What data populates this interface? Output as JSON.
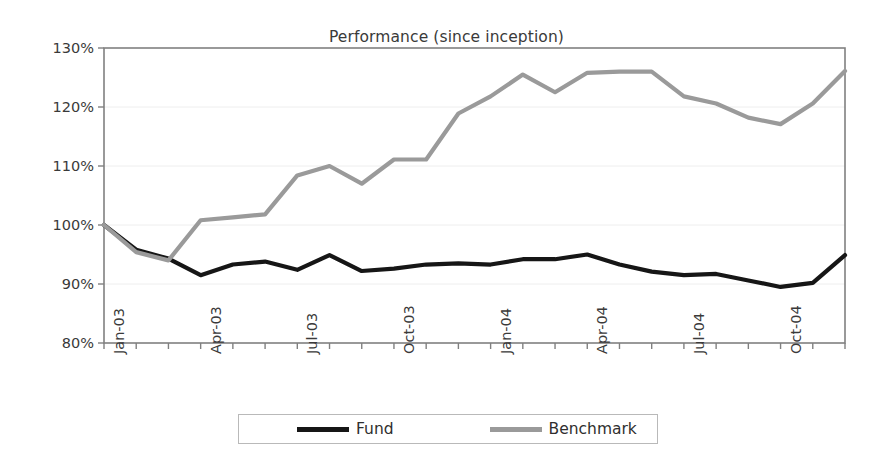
{
  "chart_data": {
    "type": "line",
    "title": "Performance (since inception)",
    "xlabel": "",
    "ylabel": "",
    "ylim": [
      80,
      130
    ],
    "ytick_values": [
      80,
      90,
      100,
      110,
      120,
      130
    ],
    "ytick_labels": [
      "80%",
      "90%",
      "100%",
      "110%",
      "120%",
      "130%"
    ],
    "grid": true,
    "grid_axis": "y",
    "legend_position": "bottom",
    "x": [
      "Jan-03",
      "Feb-03",
      "Mar-03",
      "Apr-03",
      "May-03",
      "Jun-03",
      "Jul-03",
      "Aug-03",
      "Sep-03",
      "Oct-03",
      "Nov-03",
      "Dec-03",
      "Jan-04",
      "Feb-04",
      "Mar-04",
      "Apr-04",
      "May-04",
      "Jun-04",
      "Jul-04",
      "Aug-04",
      "Sep-04",
      "Oct-04",
      "Nov-04",
      "Dec-04"
    ],
    "xtick_labels": [
      "Jan-03",
      "Apr-03",
      "Jul-03",
      "Oct-03",
      "Jan-04",
      "Apr-04",
      "Jul-04",
      "Oct-04"
    ],
    "xtick_indices": [
      0,
      3,
      6,
      9,
      12,
      15,
      18,
      21
    ],
    "series": [
      {
        "name": "Fund",
        "color": "#161616",
        "line_width": 4.2,
        "values": [
          100.0,
          95.8,
          94.3,
          91.5,
          93.3,
          93.8,
          92.4,
          94.9,
          92.2,
          92.6,
          93.3,
          93.5,
          93.3,
          94.2,
          94.2,
          95.0,
          93.3,
          92.1,
          91.5,
          91.7,
          90.6,
          89.5,
          90.2,
          94.9
        ]
      },
      {
        "name": "Benchmark",
        "color": "#9a9a9a",
        "line_width": 4.2,
        "values": [
          100.0,
          95.4,
          94.0,
          100.8,
          101.3,
          101.8,
          108.4,
          110.0,
          107.0,
          111.1,
          111.1,
          118.9,
          121.8,
          125.5,
          122.5,
          125.8,
          126.0,
          126.0,
          121.8,
          120.6,
          118.2,
          117.1,
          120.6,
          126.1
        ]
      }
    ]
  },
  "legend": {
    "entries": [
      {
        "label": "Fund",
        "color": "#161616"
      },
      {
        "label": "Benchmark",
        "color": "#9a9a9a"
      }
    ]
  },
  "axes": {
    "frame_color": "#808080",
    "grid_color": "#eeeeee"
  }
}
